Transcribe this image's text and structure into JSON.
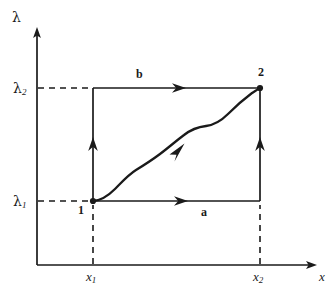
{
  "figure": {
    "kind": "thermodynamic-path-diagram",
    "background_color": "#ffffff",
    "ink_color": "#1a1a1a",
    "axes": {
      "y_axis_label": "λ",
      "x_axis_label": "x",
      "y_ticks": [
        {
          "id": "lambda1",
          "glyph": "λ",
          "subscript": "1"
        },
        {
          "id": "lambda2",
          "glyph": "λ",
          "subscript": "2"
        }
      ],
      "x_ticks": [
        {
          "id": "x1",
          "glyph": "x",
          "subscript": "1"
        },
        {
          "id": "x2",
          "glyph": "x",
          "subscript": "2"
        }
      ]
    },
    "states": [
      {
        "id": "state-1",
        "label": "1"
      },
      {
        "id": "state-2",
        "label": "2"
      }
    ],
    "paths": [
      {
        "id": "path-a",
        "label": "a",
        "description": "horizontal-then-vertical route via lower-right corner"
      },
      {
        "id": "path-b",
        "label": "b",
        "description": "vertical-then-horizontal route via upper-left corner"
      },
      {
        "id": "path-wavy",
        "label": "",
        "description": "irregular S-shaped quasi-static route from 1 to 2"
      }
    ],
    "guides": [
      {
        "id": "guide-lambda2",
        "style": "dashed"
      },
      {
        "id": "guide-lambda1",
        "style": "dashed"
      },
      {
        "id": "guide-x1",
        "style": "dashed"
      },
      {
        "id": "guide-x2",
        "style": "dashed"
      }
    ]
  }
}
